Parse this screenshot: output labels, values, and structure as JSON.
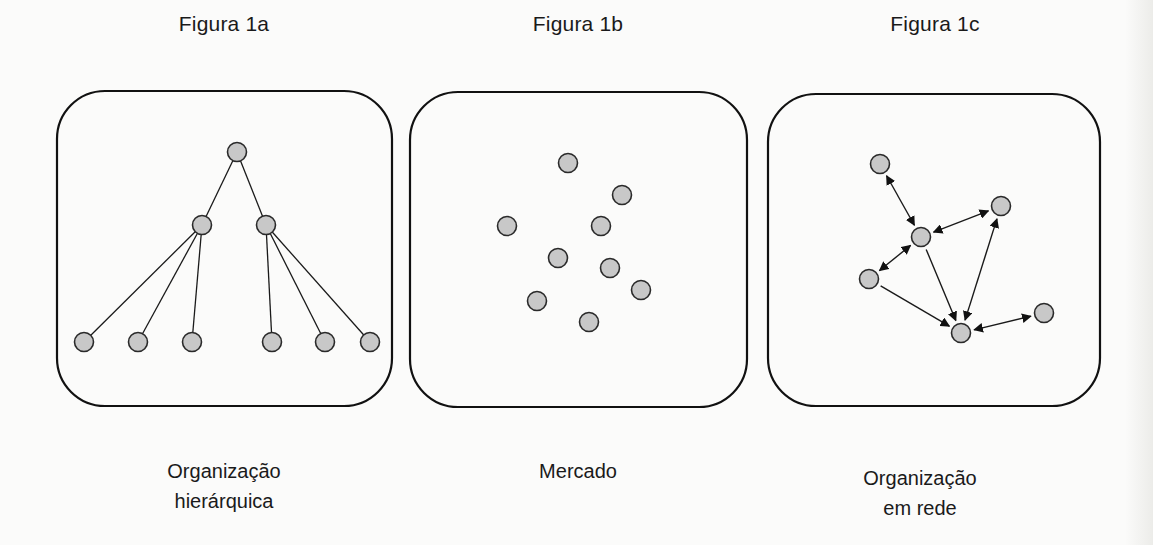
{
  "figures": [
    {
      "id": "1a",
      "title": "Figura 1a",
      "caption": "Organização\nhierárquica",
      "caption_lines": [
        "Organização",
        "hierárquica"
      ],
      "type": "hierarchy"
    },
    {
      "id": "1b",
      "title": "Figura 1b",
      "caption": "Mercado",
      "caption_lines": [
        "Mercado"
      ],
      "type": "market"
    },
    {
      "id": "1c",
      "title": "Figura 1c",
      "caption": "Organização\nem rede",
      "caption_lines": [
        "Organização",
        "em rede"
      ],
      "type": "network"
    }
  ],
  "style": {
    "node_fill": "#c8c8c8",
    "node_stroke": "#2a2a2a",
    "line_color": "#1a1a1a",
    "box_stroke": "#111111"
  },
  "diagram": {
    "boxes": [
      {
        "x": 57,
        "y": 91,
        "w": 335,
        "h": 315,
        "r": 48
      },
      {
        "x": 410,
        "y": 92,
        "w": 337,
        "h": 315,
        "r": 48
      },
      {
        "x": 768,
        "y": 94,
        "w": 332,
        "h": 312,
        "r": 48
      }
    ],
    "hierarchy": {
      "nodes": [
        {
          "id": "root",
          "x": 237,
          "y": 152
        },
        {
          "id": "m1",
          "x": 202,
          "y": 225
        },
        {
          "id": "m2",
          "x": 266,
          "y": 225
        },
        {
          "id": "l1",
          "x": 84,
          "y": 342
        },
        {
          "id": "l2",
          "x": 138,
          "y": 342
        },
        {
          "id": "l3",
          "x": 192,
          "y": 342
        },
        {
          "id": "l4",
          "x": 272,
          "y": 342
        },
        {
          "id": "l5",
          "x": 325,
          "y": 342
        },
        {
          "id": "l6",
          "x": 370,
          "y": 342
        }
      ],
      "edges": [
        [
          "root",
          "m1"
        ],
        [
          "root",
          "m2"
        ],
        [
          "m1",
          "l1"
        ],
        [
          "m1",
          "l2"
        ],
        [
          "m1",
          "l3"
        ],
        [
          "m2",
          "l4"
        ],
        [
          "m2",
          "l5"
        ],
        [
          "m2",
          "l6"
        ]
      ]
    },
    "market": {
      "nodes": [
        {
          "x": 568,
          "y": 163
        },
        {
          "x": 622,
          "y": 195
        },
        {
          "x": 507,
          "y": 226
        },
        {
          "x": 601,
          "y": 226
        },
        {
          "x": 558,
          "y": 258
        },
        {
          "x": 610,
          "y": 268
        },
        {
          "x": 641,
          "y": 290
        },
        {
          "x": 537,
          "y": 301
        },
        {
          "x": 589,
          "y": 322
        }
      ]
    },
    "network": {
      "nodes": [
        {
          "id": "A",
          "x": 880,
          "y": 164
        },
        {
          "id": "B",
          "x": 921,
          "y": 237
        },
        {
          "id": "C",
          "x": 1001,
          "y": 206
        },
        {
          "id": "D",
          "x": 869,
          "y": 279
        },
        {
          "id": "E",
          "x": 961,
          "y": 333
        },
        {
          "id": "F",
          "x": 1044,
          "y": 313
        }
      ],
      "edges": [
        {
          "from": "A",
          "to": "B",
          "dir": "both"
        },
        {
          "from": "B",
          "to": "C",
          "dir": "both"
        },
        {
          "from": "D",
          "to": "B",
          "dir": "both"
        },
        {
          "from": "B",
          "to": "E",
          "dir": "forward"
        },
        {
          "from": "E",
          "to": "C",
          "dir": "both"
        },
        {
          "from": "D",
          "to": "E",
          "dir": "forward"
        },
        {
          "from": "E",
          "to": "F",
          "dir": "both"
        }
      ]
    }
  }
}
